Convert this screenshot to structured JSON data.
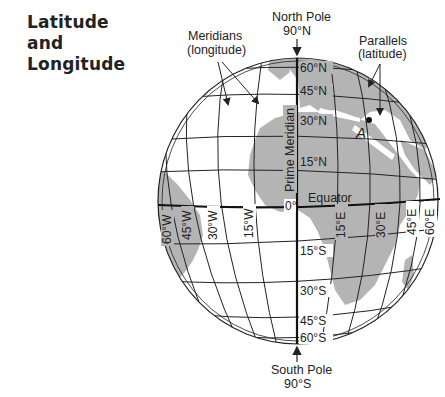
{
  "title": {
    "line1": "Latitude",
    "line2": "and",
    "line3": "Longitude"
  },
  "callouts": {
    "meridians_line1": "Meridians",
    "meridians_line2": "(longitude)",
    "parallels_line1": "Parallels",
    "parallels_line2": "(latitude)",
    "north_pole_line1": "North Pole",
    "north_pole_line2": "90°N",
    "south_pole_line1": "South Pole",
    "south_pole_line2": "90°S",
    "prime_meridian": "Prime Meridian",
    "equator": "Equator",
    "point_a": "A"
  },
  "latitude_labels": {
    "n60": "60°N",
    "n45": "45°N",
    "n30": "30°N",
    "n15": "15°N",
    "zero": "0°",
    "s15": "15°S",
    "s30": "30°S",
    "s45": "45°S",
    "s60": "60°S"
  },
  "longitude_labels": {
    "w60": "60°W",
    "w45": "45°W",
    "w30": "30°W",
    "w15": "15°W",
    "e15": "15°E",
    "e30": "30°E",
    "e45": "45°E",
    "e60": "60°E"
  },
  "colors": {
    "land": "#b4b4b4",
    "ocean": "#ffffff",
    "grid": "#222222",
    "text": "#222222"
  }
}
